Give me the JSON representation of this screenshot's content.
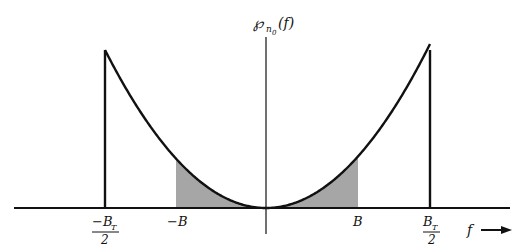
{
  "diagram": {
    "type": "power spectral density plot",
    "y_axis_label": {
      "main": "℘",
      "subscript": "n",
      "subsubscript": "0",
      "arg": "(f)"
    },
    "x_axis_label": "f",
    "x_ticks": [
      {
        "id": "neg-bt-half",
        "numerator": "−B",
        "numerator_sub": "T",
        "denominator": "2"
      },
      {
        "id": "neg-b",
        "label": "−B"
      },
      {
        "id": "pos-b",
        "label": "B"
      },
      {
        "id": "pos-bt-half",
        "numerator": "B",
        "numerator_sub": "T",
        "denominator": "2"
      }
    ],
    "curve": "parabolic (f²) between −B_T/2 and B_T/2, zero elsewhere",
    "shaded_region": "between −B and B under the curve",
    "colors": {
      "line": "#111111",
      "shade": "#a6a6a6",
      "background": "#ffffff"
    }
  }
}
